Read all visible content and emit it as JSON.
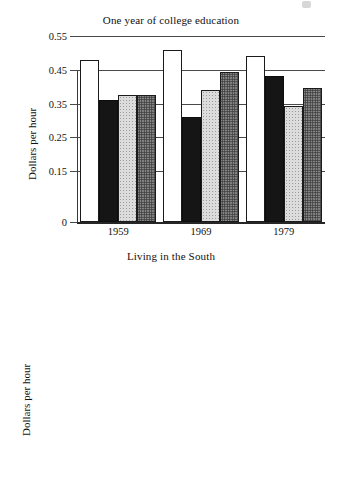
{
  "figure": {
    "background": "#ffffff",
    "ink_color": "#151515"
  },
  "chart_data": [
    {
      "type": "bar",
      "title": "One year of college education",
      "xlabel": "",
      "ylabel": "Dollars per hour",
      "categories": [
        "1959",
        "1969",
        "1979"
      ],
      "ylim": [
        0,
        0.55
      ],
      "yticks": [
        0,
        0.15,
        0.25,
        0.35,
        0.45,
        0.55
      ],
      "ytick_labels": [
        "0",
        "0.15",
        "0.25",
        "0.35",
        "0.45",
        "0.55"
      ],
      "grid": true,
      "legend": "none",
      "series": [
        {
          "name": "series-1",
          "fill": "white",
          "values": [
            0.48,
            0.51,
            0.49
          ]
        },
        {
          "name": "series-2",
          "fill": "black",
          "values": [
            0.36,
            0.31,
            0.432
          ]
        },
        {
          "name": "series-3",
          "fill": "light-gray",
          "values": [
            0.375,
            0.39,
            0.344
          ]
        },
        {
          "name": "series-4",
          "fill": "dark-gray",
          "values": [
            0.375,
            0.444,
            0.395
          ]
        }
      ]
    },
    {
      "type": "bar",
      "title": "Living in the South",
      "xlabel": "",
      "ylabel": "Dollars per hour",
      "categories": [
        "1959",
        "1969",
        "1979"
      ],
      "ylim": [
        -1.75,
        0
      ],
      "yticks": [
        0,
        -0.35,
        -0.7,
        -1.05,
        -1.4,
        -1.75
      ],
      "ytick_labels": [
        "0",
        "−$0.35",
        "−$0.70",
        "−$1.05",
        "−$1.40",
        "−$1.75"
      ],
      "grid": true,
      "legend": "none",
      "series": [
        {
          "name": "series-1",
          "fill": "white",
          "values": [
            -0.925,
            -1.08,
            -0.67
          ]
        },
        {
          "name": "series-2",
          "fill": "black",
          "values": [
            -1.4,
            -1.57,
            -0.97
          ]
        },
        {
          "name": "series-3",
          "fill": "light-gray",
          "values": [
            -0.56,
            -0.35,
            -0.29
          ]
        },
        {
          "name": "series-4",
          "fill": "dark-gray",
          "values": [
            -0.925,
            -0.91,
            -0.84
          ]
        }
      ]
    }
  ]
}
